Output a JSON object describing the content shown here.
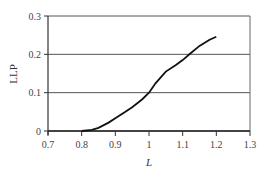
{
  "chart_data": {
    "type": "line",
    "title": "",
    "xlabel": "L",
    "ylabel": "LLP",
    "xlim": [
      0.7,
      1.3
    ],
    "ylim": [
      0,
      0.3
    ],
    "x_ticks": [
      "0.7",
      "0.8",
      "0.9",
      "1",
      "1.1",
      "1.2",
      "1.3"
    ],
    "y_ticks": [
      "0",
      "0.1",
      "0.2",
      "0.3"
    ],
    "grid": "horizontal",
    "legend": null,
    "series": [
      {
        "name": "LLP",
        "x": [
          0.8,
          0.83,
          0.85,
          0.88,
          0.9,
          0.93,
          0.95,
          0.98,
          1.0,
          1.02,
          1.05,
          1.08,
          1.1,
          1.12,
          1.15,
          1.18,
          1.2
        ],
        "y": [
          0.0,
          0.003,
          0.008,
          0.022,
          0.033,
          0.05,
          0.062,
          0.083,
          0.1,
          0.125,
          0.155,
          0.172,
          0.185,
          0.2,
          0.222,
          0.238,
          0.246
        ]
      }
    ]
  }
}
